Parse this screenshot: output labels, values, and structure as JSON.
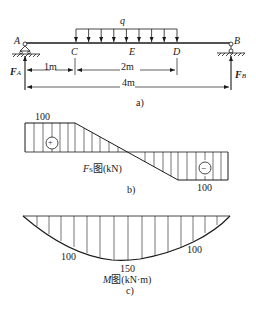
{
  "figure_a": {
    "caption": "a)",
    "points": {
      "A": "A",
      "B": "B",
      "C": "C",
      "D": "D",
      "E": "E"
    },
    "load_label": "q",
    "reaction_A": {
      "main": "F",
      "sub": "A"
    },
    "reaction_B": {
      "main": "F",
      "sub": "B"
    },
    "dimensions": {
      "AC": "1m",
      "CD": "2m",
      "AB": "4m"
    }
  },
  "figure_b": {
    "caption": "b)",
    "title_main": "F",
    "title_sub": "S",
    "title_rest": "图(kN)",
    "max_positive": "100",
    "max_negative": "100",
    "positive_sign": "+",
    "negative_sign": "−"
  },
  "figure_c": {
    "caption": "c)",
    "title_main": "M",
    "title_rest": "图(kN·m)",
    "value_left": "100",
    "value_mid": "150",
    "value_right": "100"
  }
}
